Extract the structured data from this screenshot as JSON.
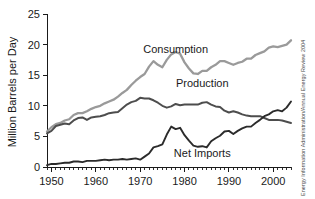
{
  "chart_data": {
    "type": "line",
    "title": "",
    "xlabel": "",
    "ylabel": "Million Barrels per Day",
    "xlim": [
      1949,
      2004
    ],
    "ylim": [
      0,
      25
    ],
    "grid": false,
    "legend_position": "inline-labels",
    "y_ticks": [
      "0",
      "5",
      "10",
      "15",
      "20",
      "25"
    ],
    "y_tick_values": [
      0,
      5,
      10,
      15,
      20,
      25
    ],
    "x_ticks": [
      "1950",
      "1960",
      "1970",
      "1980",
      "1990",
      "2000"
    ],
    "x_tick_values": [
      1950,
      1960,
      1970,
      1980,
      1990,
      2000
    ],
    "x_minor_tick_interval": 1,
    "x": [
      1949,
      1950,
      1951,
      1952,
      1953,
      1954,
      1955,
      1956,
      1957,
      1958,
      1959,
      1960,
      1961,
      1962,
      1963,
      1964,
      1965,
      1966,
      1967,
      1968,
      1969,
      1970,
      1971,
      1972,
      1973,
      1974,
      1975,
      1976,
      1977,
      1978,
      1979,
      1980,
      1981,
      1982,
      1983,
      1984,
      1985,
      1986,
      1987,
      1988,
      1989,
      1990,
      1991,
      1992,
      1993,
      1994,
      1995,
      1996,
      1997,
      1998,
      1999,
      2000,
      2001,
      2002,
      2003,
      2004
    ],
    "series": [
      {
        "name": "Consumption",
        "color": "#9a9a9a",
        "label_x": 1978,
        "label_y": 18.6,
        "values": [
          5.8,
          6.5,
          7.0,
          7.2,
          7.6,
          7.8,
          8.5,
          8.8,
          8.8,
          9.1,
          9.5,
          9.8,
          10.0,
          10.4,
          10.7,
          11.0,
          11.5,
          12.1,
          12.6,
          13.4,
          14.1,
          14.7,
          15.2,
          16.4,
          17.3,
          16.7,
          16.3,
          17.5,
          18.4,
          18.8,
          18.5,
          17.1,
          16.1,
          15.3,
          15.2,
          15.7,
          15.7,
          16.3,
          16.7,
          17.3,
          17.3,
          17.0,
          16.7,
          17.0,
          17.2,
          17.7,
          17.7,
          18.3,
          18.6,
          18.9,
          19.5,
          19.7,
          19.6,
          19.8,
          20.0,
          20.7
        ]
      },
      {
        "name": "Production",
        "color": "#4d4d4d",
        "label_x": 1984,
        "label_y": 13.0,
        "values": [
          5.5,
          5.9,
          6.7,
          6.9,
          7.1,
          7.0,
          7.6,
          8.0,
          8.1,
          7.7,
          8.1,
          8.2,
          8.3,
          8.5,
          8.8,
          8.9,
          9.0,
          9.6,
          10.2,
          10.6,
          10.8,
          11.3,
          11.2,
          11.2,
          10.9,
          10.5,
          10.0,
          9.7,
          9.9,
          10.3,
          10.1,
          10.2,
          10.2,
          10.2,
          10.2,
          10.5,
          10.6,
          10.2,
          9.9,
          9.8,
          9.2,
          8.9,
          9.1,
          8.9,
          8.6,
          8.4,
          8.3,
          8.3,
          8.3,
          8.0,
          7.7,
          7.7,
          7.7,
          7.6,
          7.4,
          7.2
        ]
      },
      {
        "name": "Net Imports",
        "color": "#2b2b2b",
        "label_x": 1984,
        "label_y": 1.6,
        "values": [
          0.3,
          0.5,
          0.5,
          0.6,
          0.7,
          0.7,
          0.9,
          0.9,
          0.8,
          1.0,
          1.0,
          1.0,
          1.1,
          1.2,
          1.1,
          1.2,
          1.2,
          1.3,
          1.2,
          1.3,
          1.4,
          1.2,
          1.7,
          2.2,
          3.2,
          3.4,
          3.7,
          5.3,
          6.6,
          6.2,
          6.4,
          5.2,
          4.3,
          3.5,
          3.3,
          3.4,
          3.2,
          4.2,
          4.7,
          5.1,
          5.8,
          5.9,
          5.4,
          5.9,
          6.3,
          6.6,
          6.6,
          7.2,
          7.7,
          8.3,
          8.6,
          9.1,
          9.3,
          9.1,
          9.7,
          10.7
        ]
      }
    ]
  },
  "source": {
    "note": "Energy Information Administration/Annual Energy Review 2004"
  }
}
